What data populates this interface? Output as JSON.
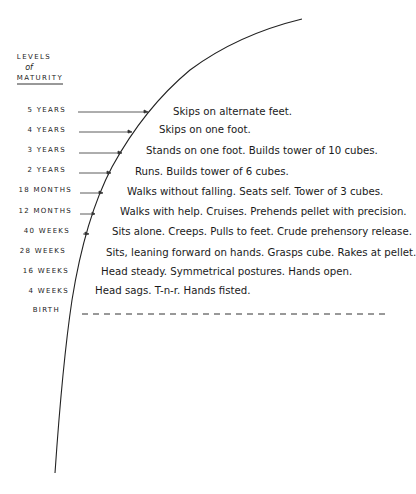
{
  "header": {
    "line1": "LEVELS",
    "line2": "of",
    "line3": "MATURITY"
  },
  "levels": [
    {
      "label": "5 YEARS",
      "description": "Skips on alternate feet."
    },
    {
      "label": "4 YEARS",
      "description": "Skips on one foot."
    },
    {
      "label": "3 YEARS",
      "description": "Stands on one foot. Builds tower of 10 cubes."
    },
    {
      "label": "2 YEARS",
      "description": "Runs. Builds tower of 6 cubes."
    },
    {
      "label": "18 MONTHS",
      "description": "Walks without falling. Seats self. Tower of 3 cubes."
    },
    {
      "label": "12 MONTHS",
      "description": "Walks with help. Cruises. Prehends pellet with precision."
    },
    {
      "label": "40 WEEKS",
      "description": "Sits alone. Creeps. Pulls to feet. Crude prehensory release."
    },
    {
      "label": "28 WEEKS",
      "description": "Sits, leaning forward on hands. Grasps cube. Rakes at pellet."
    },
    {
      "label": "16 WEEKS",
      "description": "Head steady. Symmetrical postures. Hands open."
    },
    {
      "label": "4 WEEKS",
      "description": "Head sags. T-n-r. Hands fisted."
    },
    {
      "label": "BIRTH",
      "description": ""
    }
  ],
  "colors": {
    "ink": "#1e1e1e",
    "background": "#ffffff"
  }
}
